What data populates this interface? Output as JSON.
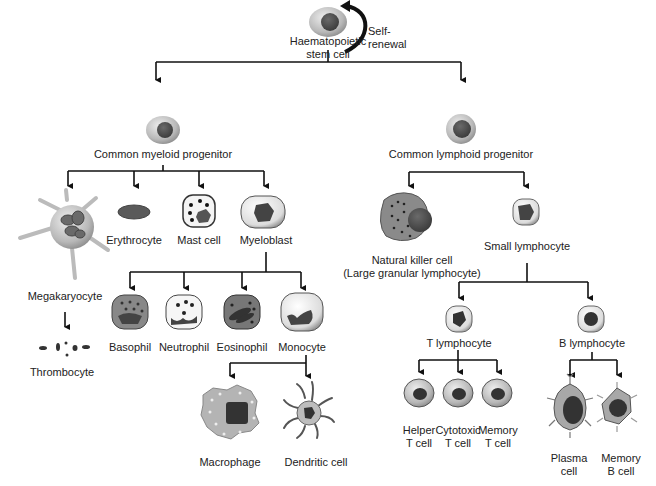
{
  "diagram": {
    "root": {
      "label_line1": "Haematopoietic",
      "label_line2": "stem cell",
      "self_renewal_line1": "Self-",
      "self_renewal_line2": "renewal"
    },
    "myeloid": {
      "label": "Common myeloid progenitor",
      "children": {
        "megakaryocyte": "Megakaryocyte",
        "thrombocyte": "Thrombocyte",
        "erythrocyte": "Erythrocyte",
        "mast_cell": "Mast cell",
        "myeloblast": "Myeloblast"
      },
      "myeloblast_children": {
        "basophil": "Basophil",
        "neutrophil": "Neutrophil",
        "eosinophil": "Eosinophil",
        "monocyte": "Monocyte"
      },
      "monocyte_children": {
        "macrophage": "Macrophage",
        "dendritic": "Dendritic cell"
      }
    },
    "lymphoid": {
      "label": "Common lymphoid progenitor",
      "nk_line1": "Natural killer cell",
      "nk_line2": "(Large granular lymphocyte)",
      "small_lymphocyte": "Small lymphocyte",
      "t_lymphocyte": "T lymphocyte",
      "b_lymphocyte": "B lymphocyte",
      "t_children": {
        "helper_l1": "Helper",
        "helper_l2": "T cell",
        "cytotoxic_l1": "Cytotoxic",
        "cytotoxic_l2": "T cell",
        "memory_l1": "Memory",
        "memory_l2": "T cell"
      },
      "b_children": {
        "plasma_l1": "Plasma",
        "plasma_l2": "cell",
        "memoryb_l1": "Memory",
        "memoryb_l2": "B cell"
      }
    }
  }
}
